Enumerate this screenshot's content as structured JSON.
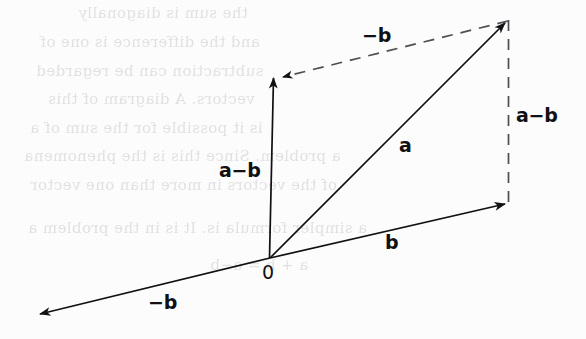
{
  "figure": {
    "kind": "vector-subtraction-parallelogram-diagram",
    "background_color": "#fcfcfc",
    "ink_color": "#111114",
    "width": 586,
    "height": 339
  },
  "labels": {
    "origin": "0",
    "vector_a": "a",
    "vector_b": "b",
    "vector_minus_b_lower": "−b",
    "vector_minus_b_upper": "−b",
    "vector_a_minus_b_left": "a−b",
    "vector_a_minus_b_right": "a−b"
  },
  "vectors": [
    {
      "name": "vector-a",
      "label": "a",
      "style": "solid",
      "from": [
        270,
        258
      ],
      "to": [
        508,
        20
      ],
      "arrowhead": "end",
      "label_pos": [
        399,
        135
      ]
    },
    {
      "name": "vector-b",
      "label": "b",
      "style": "solid",
      "from": [
        270,
        258
      ],
      "to": [
        508,
        204
      ],
      "arrowhead": "end",
      "label_pos": [
        385,
        232
      ]
    },
    {
      "name": "vector-a-minus-b-left",
      "label": "a−b",
      "style": "solid",
      "from": [
        270,
        258
      ],
      "to": [
        274,
        75
      ],
      "arrowhead": "end",
      "label_pos": [
        220,
        160
      ]
    },
    {
      "name": "vector-minus-b-lower",
      "label": "−b",
      "style": "solid",
      "from": [
        270,
        258
      ],
      "to": [
        36,
        315
      ],
      "arrowhead": "end",
      "label_pos": [
        148,
        292
      ]
    },
    {
      "name": "vector-minus-b-upper",
      "label": "−b",
      "style": "dashed",
      "from": [
        508,
        20
      ],
      "to": [
        280,
        77
      ],
      "arrowhead": "end",
      "label_pos": [
        362,
        24
      ]
    },
    {
      "name": "vector-a-minus-b-right",
      "label": "a−b",
      "style": "dashed",
      "from": [
        508,
        20
      ],
      "to": [
        508,
        204
      ],
      "arrowhead": "none",
      "label_pos": [
        516,
        105
      ]
    }
  ],
  "ghost_text": {
    "note": "faint mirrored show-through text from the reverse side of the page",
    "lines": [
      {
        "text": "the sum is diagonally",
        "x": 78,
        "y": 14,
        "size": 16
      },
      {
        "text": "and the difference is one of",
        "x": 40,
        "y": 44,
        "size": 16
      },
      {
        "text": "subtraction can be regarded",
        "x": 36,
        "y": 72,
        "size": 16
      },
      {
        "text": "vectors. A diagram of this",
        "x": 48,
        "y": 100,
        "size": 16
      },
      {
        "text": "is it possible for the sum of a",
        "x": 30,
        "y": 128,
        "size": 16
      },
      {
        "text": "a problem. Since this is the phenomena",
        "x": 24,
        "y": 156,
        "size": 16
      },
      {
        "text": "of the vectors in more than one vector",
        "x": 30,
        "y": 186,
        "size": 16
      },
      {
        "text": "a simpler formula is. It is in the problem a",
        "x": 28,
        "y": 228,
        "size": 16
      },
      {
        "text": "a + b = a−b",
        "x": 210,
        "y": 264,
        "size": 16
      }
    ]
  }
}
